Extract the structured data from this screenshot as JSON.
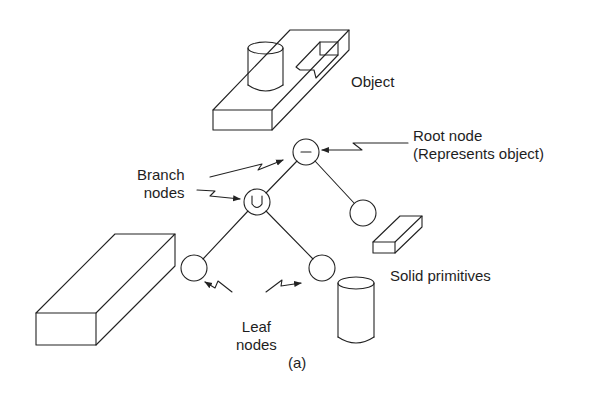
{
  "diagram": {
    "caption": "(a)",
    "labels": {
      "object": "Object",
      "root_line1": "Root node",
      "root_line2": "(Represents object)",
      "branch_line1": "Branch",
      "branch_line2": "nodes",
      "solid_primitives": "Solid primitives",
      "leaf_line1": "Leaf",
      "leaf_line2": "nodes"
    },
    "nodes": [
      {
        "id": "root",
        "operator": "−",
        "role": "Root node"
      },
      {
        "id": "union",
        "operator": "U",
        "role": "Branch node"
      },
      {
        "id": "right-leaf",
        "operator": "",
        "role": "Leaf node"
      },
      {
        "id": "left-leaf-a",
        "operator": "",
        "role": "Leaf node"
      },
      {
        "id": "left-leaf-b",
        "operator": "",
        "role": "Leaf node"
      }
    ],
    "edges": [
      [
        "root",
        "union"
      ],
      [
        "root",
        "right-leaf"
      ],
      [
        "union",
        "left-leaf-a"
      ],
      [
        "union",
        "left-leaf-b"
      ]
    ],
    "colors": {
      "stroke": "#222222",
      "background": "#ffffff"
    }
  }
}
